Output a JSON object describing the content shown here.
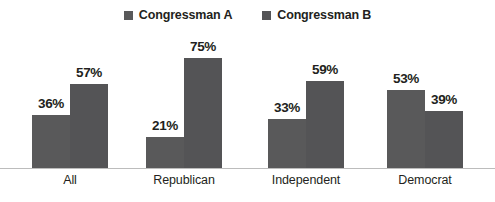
{
  "chart_data": {
    "type": "bar",
    "title": "",
    "subtitle": "",
    "xlabel": "",
    "ylabel": "",
    "ylim": [
      0,
      100
    ],
    "grid": false,
    "legend_position": "top-center",
    "value_suffix": "%",
    "categories": [
      "All",
      "Republican",
      "Independent",
      "Democrat"
    ],
    "series": [
      {
        "name": "Congressman A",
        "color": "#59595a",
        "values": [
          36,
          21,
          33,
          53
        ],
        "labels": [
          "36%",
          "21%",
          "33%",
          "53%"
        ]
      },
      {
        "name": "Congressman B",
        "color": "#545456",
        "values": [
          57,
          75,
          59,
          39
        ],
        "labels": [
          "57%",
          "75%",
          "59%",
          "39%"
        ]
      }
    ]
  },
  "legend": {
    "items": [
      {
        "label": "Congressman A",
        "color": "#59595a"
      },
      {
        "label": "Congressman B",
        "color": "#545456"
      }
    ]
  },
  "axis": {
    "baseline_color": "#bcbcbc"
  }
}
